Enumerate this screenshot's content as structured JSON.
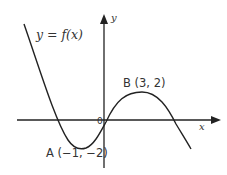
{
  "diagram": {
    "function_label": "y = f(x)",
    "x_axis_label": "x",
    "y_axis_label": "y",
    "origin_label": "0",
    "points": [
      {
        "name": "A",
        "label": "A (−1, −2)",
        "x": -1,
        "y": -2,
        "type": "minimum"
      },
      {
        "name": "B",
        "label": "B (3, 2)",
        "x": 3,
        "y": 2,
        "type": "maximum"
      }
    ],
    "colors": {
      "curve": "#222222",
      "axes": "#222222",
      "text": "#333333"
    }
  }
}
